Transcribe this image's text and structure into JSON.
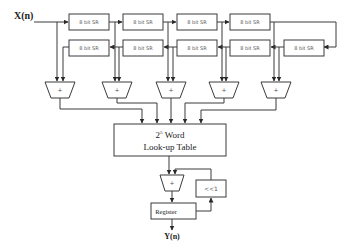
{
  "diagram": {
    "input_label": "X(n)",
    "output_label": "Y(n)",
    "shift_registers_top": [
      {
        "label": "8 bit SR"
      },
      {
        "label": "8 bit SR"
      },
      {
        "label": "8 bit SR"
      },
      {
        "label": "8 bit SR"
      }
    ],
    "shift_registers_bottom": [
      {
        "label": "8 bit SR"
      },
      {
        "label": "8 bit SR"
      },
      {
        "label": "8 bit SR"
      },
      {
        "label": "8 bit SR"
      },
      {
        "label": "8 bit SR"
      }
    ],
    "adders": [
      {
        "label": "+"
      },
      {
        "label": "+"
      },
      {
        "label": "+"
      },
      {
        "label": "+"
      },
      {
        "label": "+"
      }
    ],
    "lut": {
      "line1_base": "2",
      "line1_exp": "5",
      "line1_rest": " Word",
      "line2": "Look-up Table"
    },
    "final_adder": {
      "label": "+"
    },
    "shift_block": {
      "label": "<<1"
    },
    "register": {
      "label": "Register"
    }
  }
}
